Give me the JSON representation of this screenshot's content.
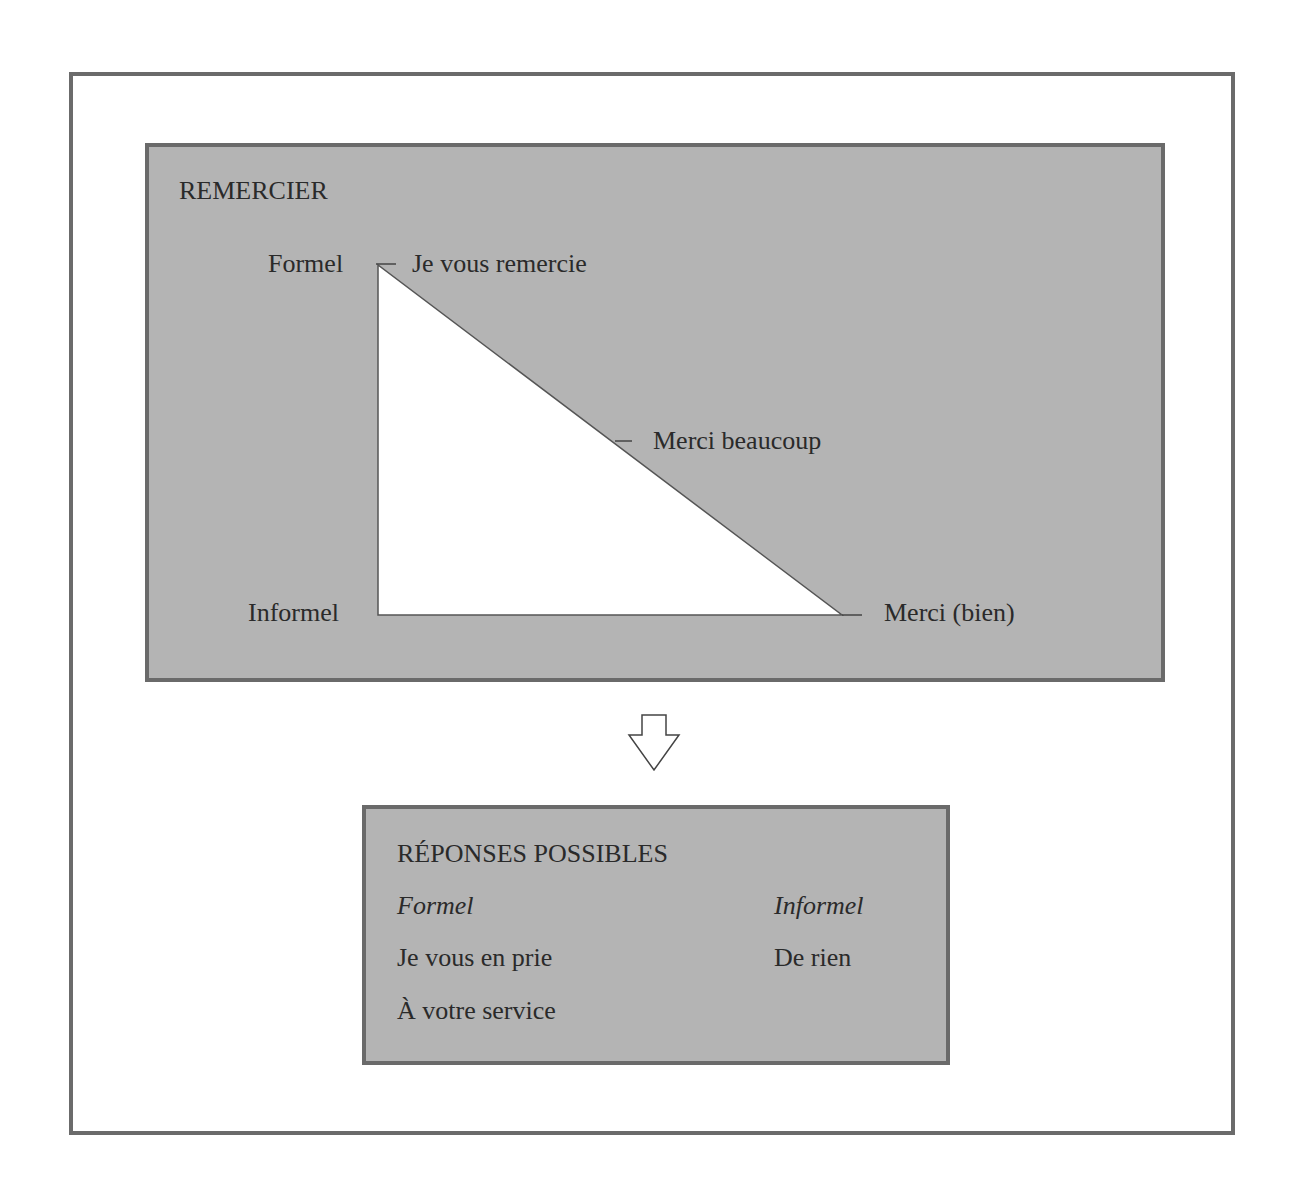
{
  "diagram": {
    "top_panel": {
      "title": "REMERCIER",
      "axis": {
        "top_label": "Formel",
        "bottom_label": "Informel"
      },
      "expressions": [
        {
          "text": "Je vous remercie",
          "level": "formel"
        },
        {
          "text": "Merci beaucoup",
          "level": "intermédiaire"
        },
        {
          "text": "Merci (bien)",
          "level": "informel"
        }
      ]
    },
    "arrow": {
      "direction": "down",
      "icon": "hollow-down-arrow-icon"
    },
    "bottom_panel": {
      "title": "RÉPONSES POSSIBLES",
      "columns": [
        {
          "header": "Formel",
          "items": [
            "Je vous en prie",
            "À votre service"
          ]
        },
        {
          "header": "Informel",
          "items": [
            "De rien"
          ]
        }
      ]
    },
    "colors": {
      "panel_fill": "#b4b4b4",
      "panel_border": "#6a6a6a",
      "frame_border": "#6b6b6b",
      "triangle_fill": "#ffffff",
      "text": "#2a2a2a"
    }
  }
}
